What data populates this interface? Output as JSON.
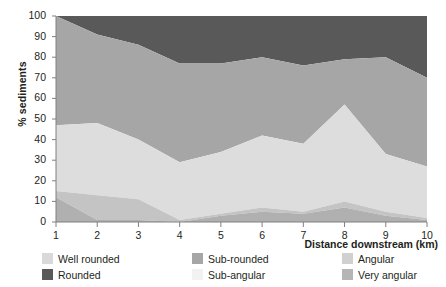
{
  "chart_data": {
    "type": "area",
    "title": "",
    "subtitle": "",
    "xlabel": "Distance downstream (km)",
    "ylabel": "% sediments",
    "x": [
      1,
      2,
      3,
      4,
      5,
      6,
      7,
      8,
      9,
      10
    ],
    "xticklabels": [
      "1",
      "2",
      "3",
      "4",
      "5",
      "6",
      "7",
      "8",
      "9",
      "10"
    ],
    "yticklabels": [
      "0",
      "10",
      "20",
      "30",
      "40",
      "50",
      "60",
      "70",
      "80",
      "90",
      "100"
    ],
    "xlim": [
      1,
      10
    ],
    "ylim": [
      0,
      100
    ],
    "grid": false,
    "stacked": true,
    "legend_position": "below",
    "series": [
      {
        "name": "Well rounded",
        "color": "#d9d9d9",
        "values": [
          76,
          48,
          41,
          29,
          34,
          42,
          38,
          57,
          33,
          27
        ]
      },
      {
        "name": "Rounded",
        "color": "#595959",
        "values": [
          24,
          14,
          13,
          19,
          18,
          13,
          20,
          20,
          16,
          14
        ]
      },
      {
        "name": "Sub-rounded",
        "color": "#a6a6a6",
        "values": [
          0,
          25,
          28,
          33,
          30,
          28,
          24,
          12,
          33,
          37
        ]
      },
      {
        "name": "Sub-angular",
        "color": "#f2f2f2",
        "values": [
          0,
          0,
          0,
          0,
          0,
          0,
          0,
          0,
          0,
          0
        ]
      },
      {
        "name": "Angular",
        "color": "#d0d0d0",
        "values": [
          0,
          0,
          0,
          0,
          0,
          0,
          0,
          0,
          0,
          0
        ]
      },
      {
        "name": "Very angular",
        "color": "#b5b5b5",
        "values": [
          0,
          13,
          18,
          19,
          18,
          17,
          18,
          11,
          18,
          22
        ]
      }
    ],
    "boundaries": {
      "note": "cumulative stacked boundary values read off the y-axis, bottom-up",
      "very_angular_top": [
        12,
        1,
        1,
        0,
        3,
        5,
        4,
        7,
        3,
        1
      ],
      "angular_top": [
        15,
        13,
        11,
        1,
        4,
        7,
        5,
        10,
        5,
        2
      ],
      "sub_angular_top": [
        47,
        48,
        40,
        29,
        34,
        42,
        38,
        57,
        33,
        27
      ],
      "sub_rounded_top": [
        100,
        91,
        86,
        77,
        77,
        80,
        76,
        79,
        80,
        70
      ],
      "rounded_top": [
        100,
        100,
        100,
        100,
        100,
        100,
        100,
        100,
        100,
        100
      ]
    }
  },
  "legend": {
    "items": [
      {
        "label": "Well rounded",
        "color": "#d9d9d9"
      },
      {
        "label": "Rounded",
        "color": "#595959"
      },
      {
        "label": "Sub-rounded",
        "color": "#a6a6a6"
      },
      {
        "label": "Sub-angular",
        "color": "#f2f2f2"
      },
      {
        "label": "Angular",
        "color": "#d0d0d0"
      },
      {
        "label": "Very angular",
        "color": "#b5b5b5"
      }
    ]
  },
  "axes": {
    "x_title": "Distance downstream (km)",
    "y_title": "% sediments",
    "y_ticks": [
      "100",
      "90",
      "80",
      "70",
      "60",
      "50",
      "40",
      "30",
      "20",
      "10",
      "0"
    ],
    "x_ticks": [
      "1",
      "2",
      "3",
      "4",
      "5",
      "6",
      "7",
      "8",
      "9",
      "10"
    ]
  }
}
